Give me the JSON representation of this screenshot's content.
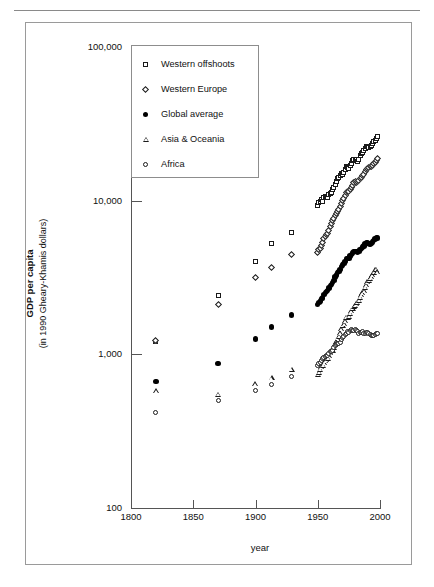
{
  "figure": {
    "yaxis_title_line1": "GDP per capita",
    "yaxis_title_line2": "(in 1990 Gheary-Khamis dollars)",
    "xaxis_title": "year"
  },
  "legend": {
    "items": [
      {
        "label": "Western offshoots",
        "symbol": "square-marker"
      },
      {
        "label": "Western Europe",
        "symbol": "diamond-marker"
      },
      {
        "label": "Global average",
        "symbol": "filled-circle-marker"
      },
      {
        "label": "Asia & Oceania",
        "symbol": "triangle-marker"
      },
      {
        "label": "Africa",
        "symbol": "open-circle-marker"
      }
    ]
  },
  "chart_data": {
    "type": "scatter",
    "title": "",
    "xlabel": "year",
    "ylabel": "GDP per capita (in 1990 Gheary-Khamis dollars)",
    "xlim": [
      1800,
      2000
    ],
    "ylim": [
      100,
      100000
    ],
    "yscale": "log",
    "xticks": [
      1800,
      1850,
      1900,
      1950,
      2000
    ],
    "xticklabels": [
      "1800",
      "1850",
      "1900",
      "1950",
      "2000"
    ],
    "yticks": [
      100,
      1000,
      10000,
      100000
    ],
    "yticklabels": [
      "100",
      "1,000",
      "10,000",
      "100,000"
    ],
    "grid": false,
    "legend_position": "upper-left-inside",
    "series": [
      {
        "name": "Western offshoots",
        "marker": "square",
        "x": [
          1820,
          1870,
          1900,
          1913,
          1929,
          1950,
          1951,
          1952,
          1953,
          1954,
          1955,
          1956,
          1957,
          1958,
          1959,
          1960,
          1961,
          1962,
          1963,
          1964,
          1965,
          1966,
          1967,
          1968,
          1969,
          1970,
          1971,
          1972,
          1973,
          1974,
          1975,
          1976,
          1977,
          1978,
          1979,
          1980,
          1981,
          1982,
          1983,
          1984,
          1985,
          1986,
          1987,
          1988,
          1989,
          1990,
          1991,
          1992,
          1993,
          1994,
          1995,
          1996,
          1997,
          1998
        ],
        "y": [
          1210,
          2420,
          4000,
          5230,
          6200,
          9270,
          9700,
          9850,
          10150,
          9950,
          10500,
          10650,
          10700,
          10500,
          11050,
          11200,
          11300,
          11800,
          12150,
          12650,
          13250,
          13900,
          14100,
          14650,
          14950,
          14900,
          15200,
          15850,
          16600,
          16400,
          16200,
          16900,
          17500,
          18150,
          18500,
          18300,
          18500,
          17950,
          18550,
          19650,
          20150,
          20600,
          21150,
          21800,
          22350,
          22550,
          22250,
          22550,
          22950,
          23650,
          24150,
          24700,
          25450,
          26150
        ]
      },
      {
        "name": "Western Europe",
        "marker": "diamond",
        "x": [
          1820,
          1870,
          1900,
          1913,
          1929,
          1950,
          1951,
          1952,
          1953,
          1954,
          1955,
          1956,
          1957,
          1958,
          1959,
          1960,
          1961,
          1962,
          1963,
          1964,
          1965,
          1966,
          1967,
          1968,
          1969,
          1970,
          1971,
          1972,
          1973,
          1974,
          1975,
          1976,
          1977,
          1978,
          1979,
          1980,
          1981,
          1982,
          1983,
          1984,
          1985,
          1986,
          1987,
          1988,
          1989,
          1990,
          1991,
          1992,
          1993,
          1994,
          1995,
          1996,
          1997,
          1998
        ],
        "y": [
          1230,
          2110,
          3150,
          3700,
          4450,
          4580,
          4800,
          4900,
          5100,
          5350,
          5650,
          5850,
          6050,
          6150,
          6400,
          6800,
          7100,
          7400,
          7650,
          8000,
          8300,
          8550,
          8750,
          9150,
          9650,
          10100,
          10350,
          10750,
          11250,
          11500,
          11400,
          11900,
          12250,
          12600,
          13050,
          13250,
          13200,
          13300,
          13550,
          13850,
          14200,
          14550,
          14900,
          15450,
          15950,
          16300,
          16500,
          16650,
          16600,
          17050,
          17450,
          17750,
          18200,
          18750
        ]
      },
      {
        "name": "Global average",
        "marker": "filled-circle",
        "x": [
          1820,
          1870,
          1900,
          1913,
          1929,
          1950,
          1951,
          1952,
          1953,
          1954,
          1955,
          1956,
          1957,
          1958,
          1959,
          1960,
          1961,
          1962,
          1963,
          1964,
          1965,
          1966,
          1967,
          1968,
          1969,
          1970,
          1971,
          1972,
          1973,
          1974,
          1975,
          1976,
          1977,
          1978,
          1979,
          1980,
          1981,
          1982,
          1983,
          1984,
          1985,
          1986,
          1987,
          1988,
          1989,
          1990,
          1991,
          1992,
          1993,
          1994,
          1995,
          1996,
          1997,
          1998
        ],
        "y": [
          667,
          870,
          1260,
          1510,
          1800,
          2110,
          2180,
          2230,
          2300,
          2330,
          2450,
          2520,
          2570,
          2600,
          2700,
          2800,
          2860,
          2940,
          3030,
          3180,
          3280,
          3400,
          3450,
          3580,
          3720,
          3820,
          3900,
          4030,
          4200,
          4220,
          4220,
          4360,
          4450,
          4570,
          4660,
          4660,
          4660,
          4620,
          4680,
          4820,
          4900,
          4980,
          5080,
          5220,
          5300,
          5300,
          5240,
          5220,
          5250,
          5380,
          5480,
          5620,
          5740,
          5710
        ]
      },
      {
        "name": "Asia & Oceania",
        "marker": "triangle",
        "x": [
          1820,
          1870,
          1900,
          1913,
          1929,
          1950,
          1951,
          1952,
          1953,
          1954,
          1955,
          1956,
          1957,
          1958,
          1959,
          1960,
          1961,
          1962,
          1963,
          1964,
          1965,
          1966,
          1967,
          1968,
          1969,
          1970,
          1971,
          1972,
          1973,
          1974,
          1975,
          1976,
          1977,
          1978,
          1979,
          1980,
          1981,
          1982,
          1983,
          1984,
          1985,
          1986,
          1987,
          1988,
          1989,
          1990,
          1991,
          1992,
          1993,
          1994,
          1995,
          1996,
          1997,
          1998
        ],
        "y": [
          580,
          550,
          640,
          700,
          800,
          740,
          765,
          800,
          830,
          845,
          880,
          905,
          920,
          940,
          975,
          1020,
          1050,
          1060,
          1110,
          1180,
          1210,
          1280,
          1310,
          1380,
          1460,
          1540,
          1580,
          1650,
          1740,
          1740,
          1770,
          1850,
          1920,
          1990,
          2050,
          2080,
          2130,
          2180,
          2250,
          2350,
          2440,
          2500,
          2590,
          2730,
          2840,
          2950,
          3020,
          3120,
          3190,
          3300,
          3420,
          3540,
          3580,
          3450
        ]
      },
      {
        "name": "Africa",
        "marker": "open-circle",
        "x": [
          1820,
          1870,
          1900,
          1913,
          1929,
          1950,
          1951,
          1952,
          1953,
          1954,
          1955,
          1956,
          1957,
          1958,
          1959,
          1960,
          1961,
          1962,
          1963,
          1964,
          1965,
          1966,
          1967,
          1968,
          1969,
          1970,
          1971,
          1972,
          1973,
          1974,
          1975,
          1976,
          1977,
          1978,
          1979,
          1980,
          1981,
          1982,
          1983,
          1984,
          1985,
          1986,
          1987,
          1988,
          1989,
          1990,
          1991,
          1992,
          1993,
          1994,
          1995,
          1996,
          1997,
          1998
        ],
        "y": [
          420,
          500,
          580,
          640,
          720,
          852,
          875,
          890,
          910,
          935,
          960,
          970,
          985,
          980,
          1010,
          1050,
          1040,
          1060,
          1100,
          1140,
          1160,
          1170,
          1180,
          1190,
          1240,
          1290,
          1310,
          1340,
          1370,
          1400,
          1390,
          1420,
          1440,
          1420,
          1430,
          1450,
          1420,
          1400,
          1370,
          1380,
          1390,
          1400,
          1370,
          1370,
          1380,
          1390,
          1370,
          1340,
          1320,
          1320,
          1330,
          1350,
          1360,
          1370
        ]
      }
    ]
  }
}
